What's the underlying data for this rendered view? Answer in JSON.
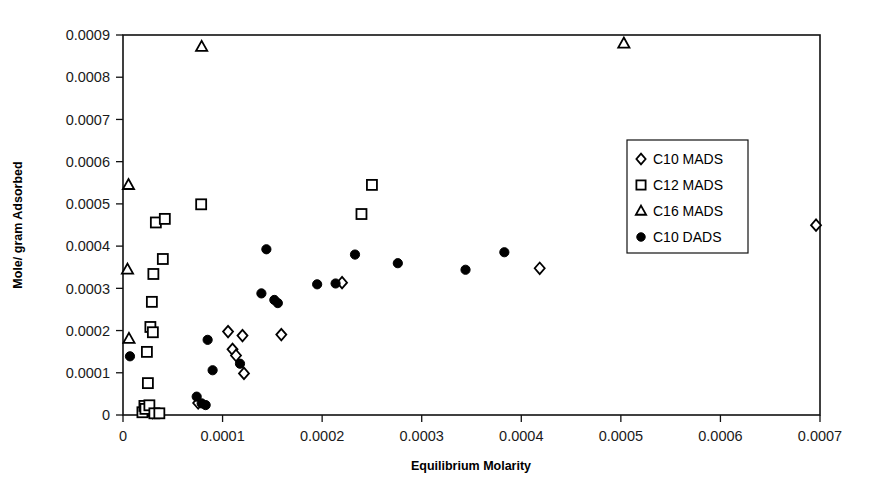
{
  "chart_data": {
    "type": "scatter",
    "title": "",
    "xlabel": "Equilibrium Molarity",
    "ylabel": "Mole/ gram Adsorbed",
    "xlim": [
      0,
      0.0007
    ],
    "ylim": [
      0,
      0.0009
    ],
    "xticks": [
      0,
      0.0001,
      0.0002,
      0.0003,
      0.0004,
      0.0005,
      0.0006,
      0.0007
    ],
    "xtick_labels": [
      "0",
      "0.0001",
      "0.0002",
      "0.0003",
      "0.0004",
      "0.0005",
      "0.0006",
      "0.0007"
    ],
    "yticks": [
      0,
      0.0001,
      0.0002,
      0.0003,
      0.0004,
      0.0005,
      0.0006,
      0.0007,
      0.0008,
      0.0009
    ],
    "ytick_labels": [
      "0",
      "0.0001",
      "0.0002",
      "0.0003",
      "0.0004",
      "0.0005",
      "0.0006",
      "0.0007",
      "0.0008",
      "0.0009"
    ],
    "grid": false,
    "legend_position": "upper right",
    "series": [
      {
        "name": "C10 MADS",
        "marker": "diamond-open",
        "points": [
          [
            2.55e-05,
            1.05e-05
          ],
          [
            2.95e-05,
            5.5e-06
          ],
          [
            7.55e-05,
            2.85e-05
          ],
          [
            0.0001055,
            0.0001975
          ],
          [
            0.00011,
            0.0001555
          ],
          [
            0.0001135,
            0.000141
          ],
          [
            0.00012,
            0.000188
          ],
          [
            0.0001215,
            9.85e-05
          ],
          [
            0.000159,
            0.0001905
          ],
          [
            0.00022,
            0.0003135
          ],
          [
            0.0004185,
            0.0003475
          ],
          [
            0.000696,
            0.0004495
          ]
        ]
      },
      {
        "name": "C12 MADS",
        "marker": "square-open",
        "points": [
          [
            1.95e-05,
            6.5e-06
          ],
          [
            2.15e-05,
            2.15e-05
          ],
          [
            2.25e-05,
            1.45e-05
          ],
          [
            2.5e-05,
            7.55e-05
          ],
          [
            2.65e-05,
            2.3e-05
          ],
          [
            3.15e-05,
            4e-06
          ],
          [
            3.65e-05,
            4e-06
          ],
          [
            2.4e-05,
            0.0001495
          ],
          [
            2.75e-05,
            0.0002085
          ],
          [
            3e-05,
            0.000196
          ],
          [
            2.9e-05,
            0.000268
          ],
          [
            3.05e-05,
            0.000334
          ],
          [
            4e-05,
            0.0003695
          ],
          [
            3.3e-05,
            0.000456
          ],
          [
            4.2e-05,
            0.0004645
          ],
          [
            7.85e-05,
            0.000499
          ],
          [
            0.0002395,
            0.000476
          ],
          [
            0.00025,
            0.000545
          ]
        ]
      },
      {
        "name": "C16 MADS",
        "marker": "triangle-open",
        "points": [
          [
            5.5e-06,
            0.000545
          ],
          [
            4.5e-06,
            0.0003445
          ],
          [
            6e-06,
            0.0001805
          ],
          [
            7.9e-05,
            0.000872
          ],
          [
            0.000503,
            0.00088
          ]
        ]
      },
      {
        "name": "C10 DADS",
        "marker": "circle-filled",
        "points": [
          [
            7e-06,
            0.000139
          ],
          [
            7.4e-05,
            4.35e-05
          ],
          [
            7.9e-05,
            2.75e-05
          ],
          [
            8.3e-05,
            2.35e-05
          ],
          [
            8.5e-05,
            0.000178
          ],
          [
            9e-05,
            0.000106
          ],
          [
            0.0001175,
            0.0001215
          ],
          [
            0.000139,
            0.000288
          ],
          [
            0.000144,
            0.0003925
          ],
          [
            0.000152,
            0.0002725
          ],
          [
            0.0001555,
            0.000265
          ],
          [
            0.000195,
            0.0003095
          ],
          [
            0.0002135,
            0.0003115
          ],
          [
            0.000233,
            0.00038
          ],
          [
            0.000276,
            0.0003595
          ],
          [
            0.000344,
            0.000344
          ],
          [
            0.000383,
            0.0003855
          ]
        ]
      }
    ]
  },
  "legend": {
    "entries": [
      {
        "label": "C10 MADS",
        "marker": "diamond-open"
      },
      {
        "label": "C12 MADS",
        "marker": "square-open"
      },
      {
        "label": "C16 MADS",
        "marker": "triangle-open"
      },
      {
        "label": "C10 DADS",
        "marker": "circle-filled"
      }
    ]
  },
  "colors": {
    "axis": "#111111",
    "marker_stroke": "#000000",
    "marker_fill_open": "#ffffff",
    "marker_fill_solid": "#000000",
    "background": "#ffffff"
  }
}
